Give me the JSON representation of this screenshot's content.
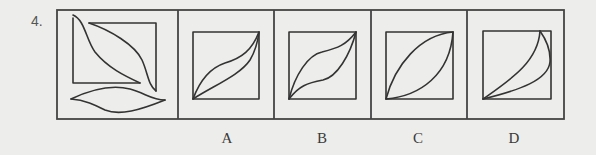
{
  "question": {
    "number": "4.",
    "options": [
      {
        "id": "A",
        "label": "A"
      },
      {
        "id": "B",
        "label": "B"
      },
      {
        "id": "C",
        "label": "C"
      },
      {
        "id": "D",
        "label": "D"
      }
    ],
    "stimulus_description": "A square frame with two separate leaf-shaped pieces (one diagonal, one horizontal) to be combined",
    "option_descriptions": {
      "A": "Square with leaf shape along diagonal, upper curve S-shaped, lower curve nearly straight",
      "B": "Square with symmetric S-curved leaf along diagonal",
      "C": "Square with lens shape along diagonal formed by two arcs",
      "D": "Square with thin crescent from bottom-left to top-right region"
    }
  },
  "colors": {
    "background": "#ededeb",
    "ink": "#333333"
  }
}
